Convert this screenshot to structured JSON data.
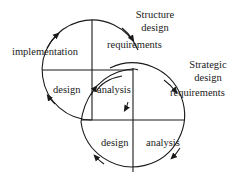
{
  "diagram": {
    "type": "spiral-cycle",
    "colors": {
      "stroke": "#1a1a1a",
      "text": "#1a1a1a",
      "background": "#ffffff"
    },
    "upper_cycle": {
      "quadrants": {
        "top_left": "implementation",
        "top_right": "requirements",
        "bottom_left": "design",
        "bottom_right": "analysis"
      },
      "header_label": [
        "Structure",
        "design"
      ]
    },
    "lower_cycle": {
      "quadrants": {
        "top_right": "requirements",
        "bottom_left": "design",
        "bottom_right": "analysis"
      },
      "header_label": [
        "Strategic",
        "design"
      ]
    }
  }
}
